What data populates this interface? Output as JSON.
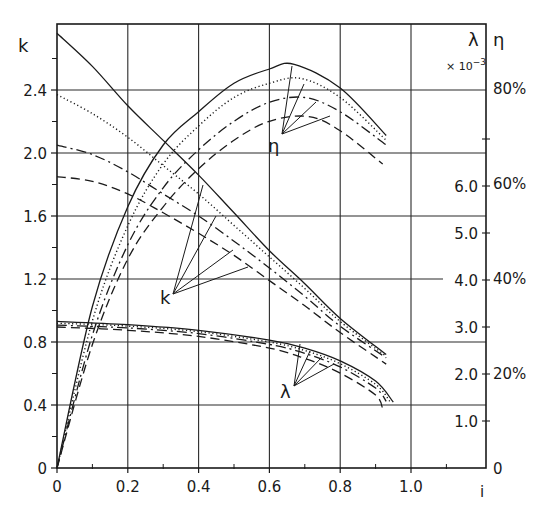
{
  "chart_data": {
    "type": "line",
    "title": "",
    "xlabel": "i",
    "ylabel_left": "k",
    "ylabel_right_1": "λ",
    "ylabel_right_1_multiplier": "× 10⁻³",
    "ylabel_right_2": "η",
    "xlim": [
      0,
      1.2
    ],
    "ylim_left": [
      0,
      2.8
    ],
    "ylim_lambda": [
      0,
      8.0
    ],
    "ylim_eta_percent": [
      0,
      80
    ],
    "grid": true,
    "legend": "none (curves labeled with leader lines: k, λ, η)",
    "x_ticks": [
      {
        "value": 0,
        "label": "0"
      },
      {
        "value": 0.2,
        "label": "0.2"
      },
      {
        "value": 0.4,
        "label": "0.4"
      },
      {
        "value": 0.6,
        "label": "0.6"
      },
      {
        "value": 0.8,
        "label": "0.8"
      },
      {
        "value": 1.0,
        "label": "1.0"
      }
    ],
    "left_ticks": [
      {
        "value": 0,
        "label": "0"
      },
      {
        "value": 0.4,
        "label": "0.4"
      },
      {
        "value": 0.8,
        "label": "0.8"
      },
      {
        "value": 1.2,
        "label": "1.2"
      },
      {
        "value": 1.6,
        "label": "1.6"
      },
      {
        "value": 2.0,
        "label": "2.0"
      },
      {
        "value": 2.4,
        "label": "2.4"
      }
    ],
    "lambda_ticks": [
      {
        "value": 1.0,
        "label": "1.0"
      },
      {
        "value": 2.0,
        "label": "2.0"
      },
      {
        "value": 3.0,
        "label": "3.0"
      },
      {
        "value": 4.0,
        "label": "4.0"
      },
      {
        "value": 5.0,
        "label": "5.0"
      },
      {
        "value": 6.0,
        "label": "6.0"
      }
    ],
    "eta_ticks": [
      {
        "value": 0,
        "label": "0"
      },
      {
        "value": 20,
        "label": "20%"
      },
      {
        "value": 40,
        "label": "40%"
      },
      {
        "value": 60,
        "label": "60%"
      },
      {
        "value": 80,
        "label": "80%"
      }
    ],
    "line_styles": [
      "solid",
      "dotted",
      "dash-dot",
      "dashed"
    ],
    "series": [
      {
        "name": "k",
        "style": "solid",
        "axis": "left",
        "x": [
          0,
          0.1,
          0.2,
          0.3,
          0.4,
          0.5,
          0.6,
          0.7,
          0.8,
          0.93
        ],
        "y": [
          2.76,
          2.55,
          2.3,
          2.08,
          1.86,
          1.62,
          1.38,
          1.17,
          0.95,
          0.72
        ]
      },
      {
        "name": "k",
        "style": "dotted",
        "axis": "left",
        "x": [
          0,
          0.1,
          0.2,
          0.3,
          0.4,
          0.5,
          0.6,
          0.7,
          0.8,
          0.93
        ],
        "y": [
          2.37,
          2.25,
          2.1,
          1.92,
          1.74,
          1.54,
          1.34,
          1.14,
          0.93,
          0.71
        ]
      },
      {
        "name": "k",
        "style": "dash-dot",
        "axis": "left",
        "x": [
          0,
          0.1,
          0.2,
          0.3,
          0.4,
          0.5,
          0.6,
          0.7,
          0.8,
          0.93
        ],
        "y": [
          2.05,
          1.99,
          1.88,
          1.74,
          1.6,
          1.44,
          1.27,
          1.09,
          0.9,
          0.7
        ]
      },
      {
        "name": "k",
        "style": "dashed",
        "axis": "left",
        "x": [
          0,
          0.1,
          0.2,
          0.3,
          0.4,
          0.5,
          0.6,
          0.7,
          0.8,
          0.93
        ],
        "y": [
          1.85,
          1.82,
          1.74,
          1.62,
          1.49,
          1.35,
          1.19,
          1.03,
          0.86,
          0.66
        ]
      },
      {
        "name": "η",
        "style": "solid",
        "axis": "eta",
        "x": [
          0,
          0.1,
          0.2,
          0.3,
          0.4,
          0.5,
          0.6,
          0.67,
          0.8,
          0.93
        ],
        "y": [
          0,
          34,
          55,
          68,
          75,
          81,
          84,
          85,
          80,
          70
        ]
      },
      {
        "name": "η",
        "style": "dotted",
        "axis": "eta",
        "x": [
          0,
          0.1,
          0.2,
          0.3,
          0.4,
          0.5,
          0.6,
          0.69,
          0.8,
          0.93
        ],
        "y": [
          0,
          31,
          51,
          64,
          72,
          78,
          81,
          82,
          78,
          69
        ]
      },
      {
        "name": "η",
        "style": "dash-dot",
        "axis": "eta",
        "x": [
          0,
          0.1,
          0.2,
          0.3,
          0.4,
          0.5,
          0.6,
          0.7,
          0.8,
          0.93
        ],
        "y": [
          0,
          28,
          47,
          59,
          67,
          73,
          77,
          78,
          75,
          68
        ]
      },
      {
        "name": "η",
        "style": "dashed",
        "axis": "eta",
        "x": [
          0,
          0.1,
          0.2,
          0.3,
          0.4,
          0.5,
          0.6,
          0.71,
          0.8,
          0.92
        ],
        "y": [
          0,
          26,
          44,
          55,
          63,
          69,
          73,
          74,
          71,
          64
        ]
      },
      {
        "name": "λ",
        "style": "solid",
        "axis": "lambda",
        "x": [
          0,
          0.2,
          0.4,
          0.6,
          0.7,
          0.8,
          0.9,
          0.95
        ],
        "y": [
          3.12,
          3.05,
          2.93,
          2.72,
          2.55,
          2.28,
          1.85,
          1.4
        ]
      },
      {
        "name": "λ",
        "style": "dotted",
        "axis": "lambda",
        "x": [
          0,
          0.2,
          0.4,
          0.6,
          0.7,
          0.8,
          0.9,
          0.94
        ],
        "y": [
          3.08,
          3.02,
          2.9,
          2.68,
          2.5,
          2.22,
          1.78,
          1.42
        ]
      },
      {
        "name": "λ",
        "style": "dash-dot",
        "axis": "lambda",
        "x": [
          0,
          0.2,
          0.4,
          0.6,
          0.7,
          0.8,
          0.9,
          0.93
        ],
        "y": [
          3.04,
          2.98,
          2.86,
          2.63,
          2.44,
          2.15,
          1.7,
          1.42
        ]
      },
      {
        "name": "λ",
        "style": "dashed",
        "axis": "lambda",
        "x": [
          0,
          0.2,
          0.4,
          0.6,
          0.7,
          0.8,
          0.9,
          0.92
        ],
        "y": [
          3.0,
          2.93,
          2.8,
          2.55,
          2.33,
          2.02,
          1.55,
          1.25
        ]
      }
    ],
    "annotations": [
      {
        "text": "k",
        "target": "k curves",
        "x": 0.33,
        "y_left": 1.12
      },
      {
        "text": "η",
        "target": "η curves",
        "x": 0.61,
        "y_left": 2.05
      },
      {
        "text": "λ",
        "target": "λ curves",
        "x": 0.64,
        "y_left": 0.48
      }
    ]
  },
  "labels": {
    "k": "k",
    "lambda": "λ",
    "eta": "η",
    "multiplier": "× 10",
    "multiplier_exp": "−3",
    "x_axis": "i",
    "curve_label_k": "k",
    "curve_label_eta": "η",
    "curve_label_lambda": "λ"
  },
  "colors": {
    "ink": "#1a1a1a",
    "grid": "#2a2a2a",
    "background": "#ffffff"
  }
}
